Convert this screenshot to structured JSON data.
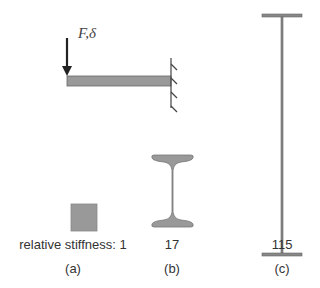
{
  "diagram": {
    "force_label": "F,δ",
    "panels": [
      {
        "id": "a",
        "caption": "(a)",
        "stiffness_label": "relative stiffness: 1",
        "shape": "solid-square-section"
      },
      {
        "id": "b",
        "caption": "(b)",
        "stiffness_label": "17",
        "shape": "i-beam-section"
      },
      {
        "id": "c",
        "caption": "(c)",
        "stiffness_label": "115",
        "shape": "tall-thin-i-section"
      }
    ],
    "colors": {
      "fill": "#999999",
      "stroke": "#555555",
      "arrow": "#222222",
      "text": "#333333"
    }
  }
}
